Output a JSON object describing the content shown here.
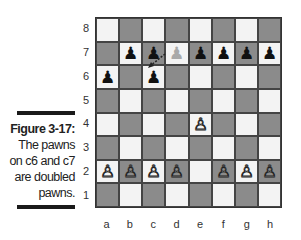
{
  "caption": {
    "figure": "Figure 3-17:",
    "lines": [
      "The pawns",
      "on c6 and c7",
      "are doubled",
      "pawns."
    ]
  },
  "ranks": [
    "8",
    "7",
    "6",
    "5",
    "4",
    "3",
    "2",
    "1"
  ],
  "files": [
    "a",
    "b",
    "c",
    "d",
    "e",
    "f",
    "g",
    "h"
  ],
  "colors": {
    "dark_square": "#8b8b8b",
    "light_square": "#f3f3f3",
    "border": "#333333"
  },
  "pieces": [
    {
      "square": "b7",
      "type": "pawn",
      "color": "black",
      "glyph": "♟"
    },
    {
      "square": "c7",
      "type": "pawn",
      "color": "black",
      "glyph": "♟"
    },
    {
      "square": "d7",
      "type": "pawn",
      "color": "ghost",
      "glyph": "♟"
    },
    {
      "square": "e7",
      "type": "pawn",
      "color": "black",
      "glyph": "♟"
    },
    {
      "square": "f7",
      "type": "pawn",
      "color": "black",
      "glyph": "♟"
    },
    {
      "square": "g7",
      "type": "pawn",
      "color": "black",
      "glyph": "♟"
    },
    {
      "square": "h7",
      "type": "pawn",
      "color": "black",
      "glyph": "♟"
    },
    {
      "square": "a6",
      "type": "pawn",
      "color": "black",
      "glyph": "♟"
    },
    {
      "square": "c6",
      "type": "pawn",
      "color": "black",
      "glyph": "♟"
    },
    {
      "square": "e4",
      "type": "pawn",
      "color": "white",
      "glyph": "♙"
    },
    {
      "square": "a2",
      "type": "pawn",
      "color": "white",
      "glyph": "♙"
    },
    {
      "square": "b2",
      "type": "pawn",
      "color": "white",
      "glyph": "♙"
    },
    {
      "square": "c2",
      "type": "pawn",
      "color": "white",
      "glyph": "♙"
    },
    {
      "square": "d2",
      "type": "pawn",
      "color": "white",
      "glyph": "♙"
    },
    {
      "square": "f2",
      "type": "pawn",
      "color": "white",
      "glyph": "♙"
    },
    {
      "square": "g2",
      "type": "pawn",
      "color": "white",
      "glyph": "♙"
    },
    {
      "square": "h2",
      "type": "pawn",
      "color": "white",
      "glyph": "♙"
    }
  ],
  "arrow": {
    "from": "d7",
    "to": "c6",
    "style": "dashed"
  }
}
